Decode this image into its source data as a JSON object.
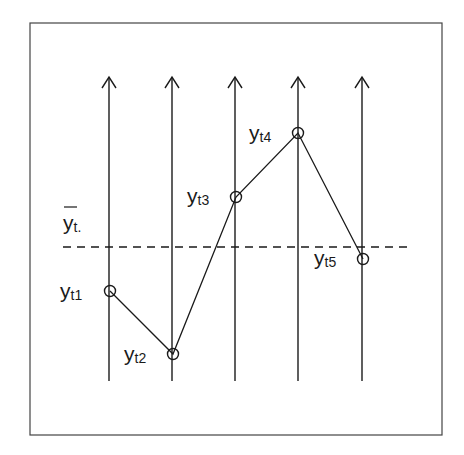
{
  "diagram": {
    "frame": {
      "x": 30,
      "y": 23,
      "width": 412,
      "height": 412,
      "stroke": "#444444"
    },
    "colors": {
      "line": "#1a1a1a",
      "frame": "#444444",
      "background": "#ffffff"
    },
    "axes": {
      "top_y": 77,
      "bottom_y": 381,
      "x_positions": [
        109,
        172,
        235,
        298,
        362
      ]
    },
    "mean_line": {
      "y": 247,
      "x_start": 63,
      "x_end": 408,
      "style": "dashed",
      "label": {
        "main": "y",
        "sub": "t.",
        "overbar": true
      }
    },
    "points": [
      {
        "id": "yt1",
        "main": "y",
        "sub": "t1",
        "x": 110,
        "y": 291,
        "label_x": 60,
        "label_y": 298
      },
      {
        "id": "yt2",
        "main": "y",
        "sub": "t2",
        "x": 173,
        "y": 354,
        "label_x": 124,
        "label_y": 361
      },
      {
        "id": "yt3",
        "main": "y",
        "sub": "t3",
        "x": 236,
        "y": 197,
        "label_x": 187,
        "label_y": 203
      },
      {
        "id": "yt4",
        "main": "y",
        "sub": "t4",
        "x": 298,
        "y": 133,
        "label_x": 249,
        "label_y": 140
      },
      {
        "id": "yt5",
        "main": "y",
        "sub": "t5",
        "x": 363,
        "y": 259,
        "label_x": 314,
        "label_y": 265
      }
    ]
  }
}
